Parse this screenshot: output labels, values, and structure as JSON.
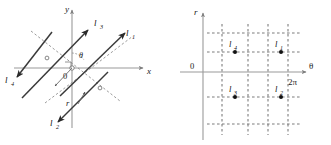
{
  "figure": {
    "background": "#ffffff",
    "ink": "#1a1a1a",
    "axis_color": "#9a9a9a",
    "line_color": "#3a3a3a",
    "dash_color": "#8a8a8a"
  },
  "left_panel": {
    "name": "cartesian-line-diagram",
    "axes": {
      "x_label": "x",
      "y_label": "y",
      "origin_label": "0"
    },
    "annotations": {
      "angle_label": "θ",
      "radius_label": "r"
    },
    "lines": [
      {
        "id": "l1",
        "label": "l₁",
        "label_text": "l",
        "sub": "1"
      },
      {
        "id": "l2",
        "label": "l₂",
        "label_text": "l",
        "sub": "2"
      },
      {
        "id": "l3",
        "label": "l₃",
        "label_text": "l",
        "sub": "3"
      },
      {
        "id": "l4",
        "label": "l₄",
        "label_text": "l",
        "sub": "4"
      }
    ]
  },
  "right_panel": {
    "name": "parameter-space-diagram",
    "axes": {
      "x_label": "θ",
      "y_label": "r",
      "origin_label": "0",
      "x_max_tick": "2π"
    },
    "points": [
      {
        "id": "l4",
        "label_text": "l",
        "sub": "4",
        "quadrant": "upper-left"
      },
      {
        "id": "l1",
        "label_text": "l",
        "sub": "1",
        "quadrant": "upper-right"
      },
      {
        "id": "l3",
        "label_text": "l",
        "sub": "3",
        "quadrant": "lower-left"
      },
      {
        "id": "l2",
        "label_text": "l",
        "sub": "2",
        "quadrant": "lower-right"
      }
    ],
    "grid": {
      "style": "dashed",
      "vertical_count": 4,
      "horizontal_count": 4
    }
  }
}
